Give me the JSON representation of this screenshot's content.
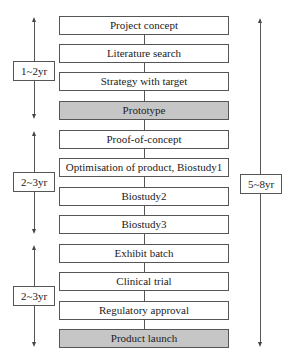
{
  "steps": [
    {
      "label": "Project concept",
      "milestone": false
    },
    {
      "label": "Literature search",
      "milestone": false
    },
    {
      "label": "Strategy with target",
      "milestone": false
    },
    {
      "label": "Prototype",
      "milestone": true
    },
    {
      "label": "Proof-of-concept",
      "milestone": false
    },
    {
      "label": "Optimisation of product, Biostudy1",
      "milestone": false
    },
    {
      "label": "Biostudy2",
      "milestone": false
    },
    {
      "label": "Biostudy3",
      "milestone": false
    },
    {
      "label": "Exhibit batch",
      "milestone": false
    },
    {
      "label": "Clinical trial",
      "milestone": false
    },
    {
      "label": "Regulatory approval",
      "milestone": false
    },
    {
      "label": "Product launch",
      "milestone": true
    }
  ],
  "durations": {
    "phase1": "1~2yr",
    "phase2": "2~3yr",
    "phase3": "2~3yr",
    "total": "5~8yr"
  },
  "colors": {
    "milestone_fill": "#c6c6c6",
    "line": "#555555"
  }
}
